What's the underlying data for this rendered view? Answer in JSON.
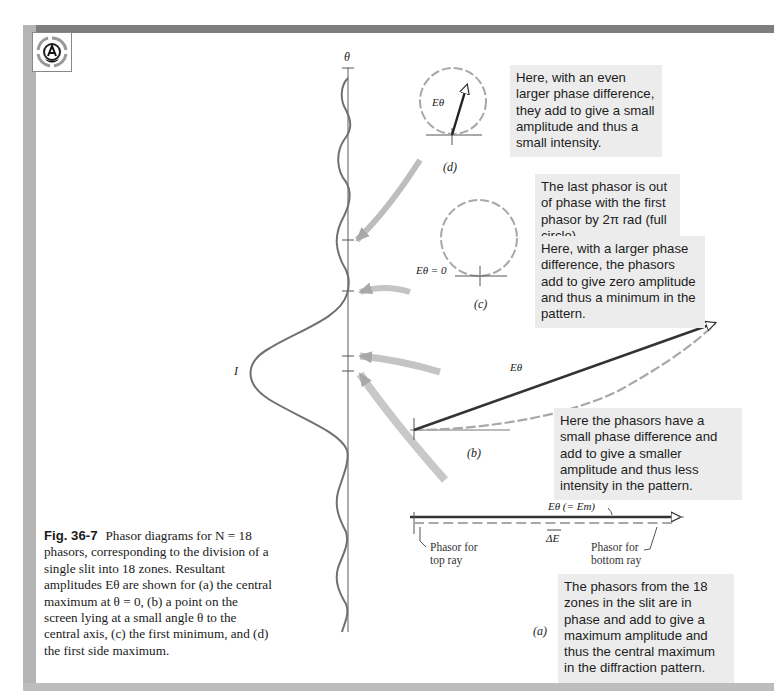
{
  "page": {
    "logo_icon": "publisher-logo-icon"
  },
  "figure": {
    "axis": {
      "theta_label": "θ",
      "intensity_label": "I"
    },
    "panels": {
      "d": {
        "label": "(d)",
        "vector_label": "Eθ",
        "note": "Here, with an even larger phase difference, they add to give a small amplitude and thus a small intensity."
      },
      "c": {
        "label": "(c)",
        "vector_label": "Eθ = 0",
        "note_top": "The last phasor is out of phase with the first phasor by 2π rad (full circle).",
        "note": "Here, with a larger phase difference, the phasors add to give zero amplitude and thus a minimum in the pattern."
      },
      "b": {
        "label": "(b)",
        "vector_label": "Eθ",
        "note": "Here the phasors have a small phase difference and add to give a smaller amplitude and thus less intensity in the pattern."
      },
      "a": {
        "label": "(a)",
        "vector_label": "Eθ (= Em)",
        "delta_label": "ΔE",
        "top_phasor_label": "Phasor for top ray",
        "bottom_phasor_label": "Phasor for bottom ray",
        "note": "The phasors from the 18 zones in the slit are in phase and add to give a maximum amplitude and thus the central maximum in the diffraction pattern."
      }
    },
    "phasor_count": 18
  },
  "caption": {
    "label": "Fig. 36-7",
    "text": "Phasor diagrams for N = 18 phasors, corresponding to the division of a single slit into 18 zones. Resultant amplitudes Eθ are shown for (a) the central maximum at θ = 0, (b) a point on the screen lying at a small angle θ to the central axis, (c) the first minimum, and (d) the first side maximum."
  }
}
